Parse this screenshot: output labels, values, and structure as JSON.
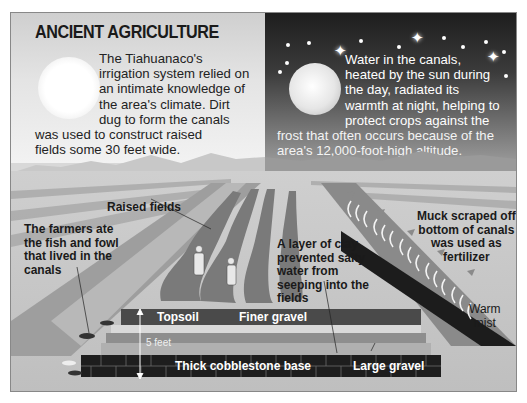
{
  "title": "ANCIENT AGRICULTURE",
  "day_panel": {
    "text_lines": [
      "The Tiahuanaco's",
      "irrigation system relied on",
      "an intimate knowledge of",
      "the area's climate. Dirt",
      "dug to form the canals"
    ],
    "tail_lines": [
      "was used to construct raised",
      "fields some 30 feet wide."
    ],
    "icon": "sun-icon"
  },
  "night_panel": {
    "text_lines": [
      "Water in the canals,",
      "heated by the sun during",
      "the day, radiated its",
      "warmth at night, helping to",
      "protect crops against the"
    ],
    "tail_lines": [
      "frost that often occurs because of the",
      "area's 12,000-foot-high altitude."
    ],
    "icon": "moon-icon"
  },
  "labels": {
    "raised_fields": "Raised fields",
    "farmers": [
      "The farmers ate",
      "the fish and fowl",
      "that lived in the",
      "canals"
    ],
    "clay": [
      "A layer of clay",
      "prevented salty",
      "water from",
      "seeping into the",
      "fields"
    ],
    "muck": [
      "Muck scraped off",
      "bottom of canals",
      "was used as",
      "fertilizer"
    ],
    "warm_mist": [
      "Warm",
      "mist"
    ],
    "topsoil": "Topsoil",
    "finer_gravel": "Finer gravel",
    "five_feet": "5 feet",
    "cobblestone": "Thick cobblestone base",
    "large_gravel": "Large gravel"
  },
  "colors": {
    "day_sky": "#e4e4e4",
    "night_sky": "#2a2a2a",
    "topsoil": "#4a4a4a",
    "cobblestone": "#1e1e1e",
    "field": "#7a7a7a"
  }
}
